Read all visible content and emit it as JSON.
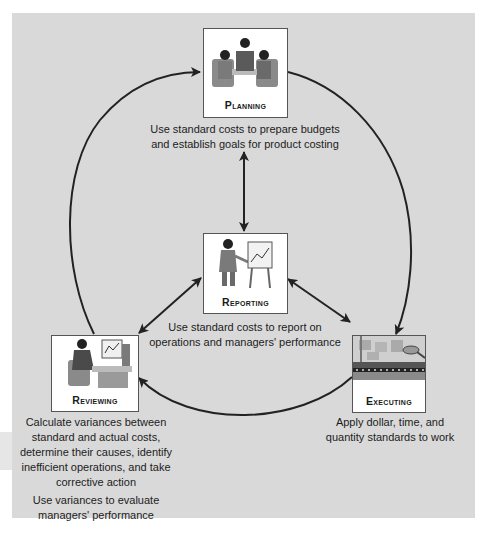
{
  "diagram": {
    "type": "cycle",
    "background_color": "#d9d9d9",
    "arrow_color": "#222222",
    "nodes": {
      "planning": {
        "label": "PLANNING",
        "icon": "meeting-people-icon",
        "description": [
          "Use standard costs to prepare budgets",
          "and establish goals for product costing"
        ]
      },
      "reporting": {
        "label": "REPORTING",
        "icon": "presenter-with-chart-icon",
        "description": [
          "Use standard costs to report on",
          "operations and managers' performance"
        ]
      },
      "reviewing": {
        "label": "REVIEWING",
        "icon": "person-at-computer-icon",
        "description_1": [
          "Calculate variances between",
          "standard and actual costs,",
          "determine their causes, identify",
          "inefficient operations, and take",
          "corrective action"
        ],
        "description_2": [
          "Use variances to evaluate",
          "managers' performance"
        ]
      },
      "executing": {
        "label": "EXECUTING",
        "icon": "assembly-line-icon",
        "description": [
          "Apply dollar, time, and",
          "quantity standards to work"
        ]
      }
    },
    "edges": [
      {
        "from": "planning",
        "to": "executing",
        "style": "arc",
        "direction": "one-way"
      },
      {
        "from": "executing",
        "to": "reviewing",
        "style": "arc",
        "direction": "one-way"
      },
      {
        "from": "reviewing",
        "to": "planning",
        "style": "arc",
        "direction": "one-way"
      },
      {
        "from": "planning",
        "to": "reporting",
        "style": "straight",
        "direction": "two-way"
      },
      {
        "from": "reporting",
        "to": "reviewing",
        "style": "straight",
        "direction": "two-way"
      },
      {
        "from": "reporting",
        "to": "executing",
        "style": "straight",
        "direction": "two-way"
      }
    ]
  }
}
